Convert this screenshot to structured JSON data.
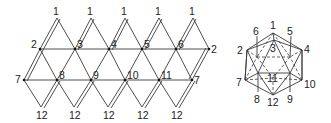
{
  "net": {
    "title": "Icosahedron net",
    "top_labels": [
      "1",
      "1",
      "1",
      "1",
      "1"
    ],
    "upper_labels": [
      "2",
      "3",
      "4",
      "5",
      "6",
      "2"
    ],
    "lower_labels": [
      "7",
      "8",
      "9",
      "10",
      "11",
      "7"
    ],
    "bottom_labels": [
      "12",
      "12",
      "12",
      "12",
      "12"
    ]
  },
  "solid": {
    "title": "Icosahedron",
    "labels": {
      "v1": "1",
      "v2": "2",
      "v3": "3",
      "v4": "4",
      "v5": "5",
      "v6": "6",
      "v7": "7",
      "v8": "8",
      "v9": "9",
      "v10": "10",
      "v11": "11",
      "v12": "12"
    }
  }
}
